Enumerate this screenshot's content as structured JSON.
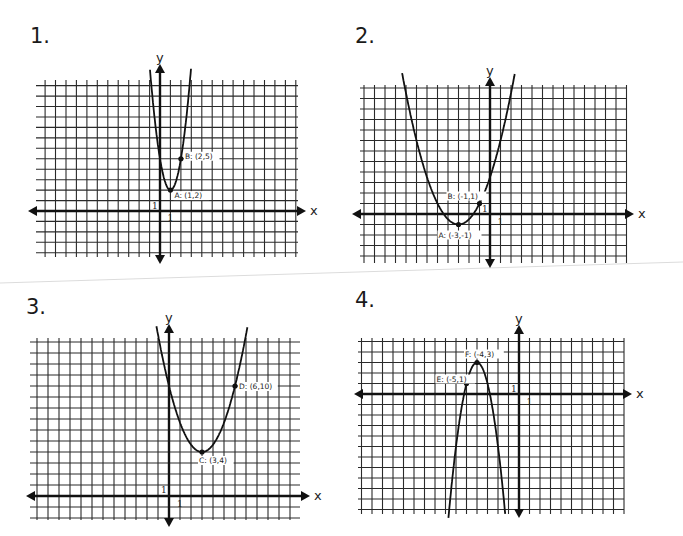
{
  "page": {
    "separator_color": "#d8d8d8"
  },
  "problems": [
    {
      "number": "1.",
      "axis_labels": {
        "x": "x",
        "y": "y"
      },
      "unit_labels": {
        "x": "1",
        "y": "1"
      },
      "points": [
        {
          "name": "A",
          "label": "A: (1,2)",
          "x": 1,
          "y": 2
        },
        {
          "name": "B",
          "label": "B: (2,5)",
          "x": 2,
          "y": 5
        }
      ]
    },
    {
      "number": "2.",
      "axis_labels": {
        "x": "x",
        "y": "y"
      },
      "unit_labels": {
        "x": "1",
        "y": "1"
      },
      "points": [
        {
          "name": "A",
          "label": "A: (-3,-1)",
          "x": -3,
          "y": -1
        },
        {
          "name": "B",
          "label": "B: (-1,1)",
          "x": -1,
          "y": 1
        }
      ]
    },
    {
      "number": "3.",
      "axis_labels": {
        "x": "x",
        "y": "y"
      },
      "unit_labels": {
        "x": "1",
        "y": "1"
      },
      "points": [
        {
          "name": "C",
          "label": "C: (3,4)",
          "x": 3,
          "y": 4
        },
        {
          "name": "D",
          "label": "D: (6,10)",
          "x": 6,
          "y": 10
        }
      ]
    },
    {
      "number": "4.",
      "axis_labels": {
        "x": "x",
        "y": "y"
      },
      "unit_labels": {
        "x": "1",
        "y": "1"
      },
      "points": [
        {
          "name": "E",
          "label": "E: (-5,1)",
          "x": -5,
          "y": 1
        },
        {
          "name": "F",
          "label": "F: (-4,3)",
          "x": -4,
          "y": 3
        }
      ]
    }
  ],
  "chart_data": [
    {
      "type": "line",
      "title": "1.",
      "xlabel": "x",
      "ylabel": "y",
      "grid": true,
      "xlim": [
        -12,
        13
      ],
      "ylim": [
        -4,
        12
      ],
      "function": "y = 3(x-1)^2 + 2",
      "vertex": {
        "label": "A",
        "x": 1,
        "y": 2
      },
      "points": [
        {
          "label": "A: (1,2)",
          "x": 1,
          "y": 2
        },
        {
          "label": "B: (2,5)",
          "x": 2,
          "y": 5
        }
      ],
      "coef": {
        "a": 3,
        "h": 1,
        "k": 2
      }
    },
    {
      "type": "line",
      "title": "2.",
      "xlabel": "x",
      "ylabel": "y",
      "grid": true,
      "xlim": [
        -12,
        13
      ],
      "ylim": [
        -5,
        12
      ],
      "function": "y = 0.5(x+3)^2 - 1",
      "vertex": {
        "label": "A",
        "x": -3,
        "y": -1
      },
      "points": [
        {
          "label": "A: (-3,-1)",
          "x": -3,
          "y": -1
        },
        {
          "label": "B: (-1,1)",
          "x": -1,
          "y": 1
        }
      ],
      "coef": {
        "a": 0.5,
        "h": -3,
        "k": -1
      }
    },
    {
      "type": "line",
      "title": "3.",
      "xlabel": "x",
      "ylabel": "y",
      "grid": true,
      "xlim": [
        -12,
        12
      ],
      "ylim": [
        -2,
        14
      ],
      "function": "y = (2/3)(x-3)^2 + 4",
      "vertex": {
        "label": "C",
        "x": 3,
        "y": 4
      },
      "points": [
        {
          "label": "C: (3,4)",
          "x": 3,
          "y": 4
        },
        {
          "label": "D: (6,10)",
          "x": 6,
          "y": 10
        }
      ],
      "coef": {
        "a": 0.6667,
        "h": 3,
        "k": 4
      }
    },
    {
      "type": "line",
      "title": "4.",
      "xlabel": "x",
      "ylabel": "y",
      "grid": true,
      "xlim": [
        -15,
        10
      ],
      "ylim": [
        -11,
        5
      ],
      "function": "y = -2(x+4)^2 + 3",
      "vertex": {
        "label": "F",
        "x": -4,
        "y": 3
      },
      "points": [
        {
          "label": "E: (-5,1)",
          "x": -5,
          "y": 1
        },
        {
          "label": "F: (-4,3)",
          "x": -4,
          "y": 3
        }
      ],
      "coef": {
        "a": -2,
        "h": -4,
        "k": 3
      }
    }
  ],
  "layout": {
    "graphs": [
      {
        "ox": 160,
        "oy": 211,
        "s": 10.45,
        "left": 36,
        "right": 298,
        "top": 80,
        "bottom": 257,
        "numX": 32,
        "numY": 48,
        "xArrowL": 28,
        "xArrowR": 306,
        "yArrowT": 64,
        "yArrowB": 264,
        "labels": {
          "A": [
            4,
            8
          ],
          "B": [
            4,
            0
          ]
        }
      },
      {
        "ox": 490,
        "oy": 214,
        "s": 10.5,
        "left": 360,
        "right": 626,
        "top": 85,
        "bottom": 263,
        "numX": 355,
        "numY": 48,
        "xArrowL": 352,
        "xArrowR": 634,
        "yArrowT": 77,
        "yArrowB": 268,
        "labels": {
          "A": [
            -20,
            13
          ],
          "B": [
            -32,
            -5
          ]
        }
      },
      {
        "ox": 169,
        "oy": 496,
        "s": 11.0,
        "left": 30,
        "right": 300,
        "top": 338,
        "bottom": 520,
        "numX": 26,
        "numY": 318,
        "xArrowL": 26,
        "xArrowR": 310,
        "yArrowT": 324,
        "yArrowB": 527,
        "labels": {
          "C": [
            -3,
            11
          ],
          "D": [
            4,
            3
          ]
        }
      },
      {
        "ox": 519,
        "oy": 394,
        "s": 10.5,
        "left": 358,
        "right": 624,
        "top": 338,
        "bottom": 514,
        "numX": 355,
        "numY": 300,
        "xArrowL": 354,
        "xArrowR": 632,
        "yArrowT": 325,
        "yArrowB": 518,
        "labels": {
          "E": [
            -30,
            -2
          ],
          "F": [
            -12,
            -6
          ]
        }
      }
    ]
  }
}
